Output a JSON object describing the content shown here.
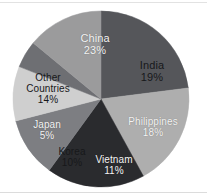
{
  "chart_data": {
    "type": "pie",
    "title": "",
    "subtitle": "",
    "xlabel": "",
    "ylabel": "",
    "legend_position": "none",
    "labels_inside_slices": true,
    "grid": false,
    "units": "percent",
    "total": 100,
    "categories": [
      "China",
      "India",
      "Philippines",
      "Vietnam",
      "Korea",
      "Japan",
      "Other Countries"
    ],
    "values": [
      23,
      19,
      18,
      11,
      10,
      5,
      14
    ],
    "slices": [
      {
        "name": "China",
        "value": 23,
        "value_label": "23%",
        "color": "#55565a",
        "text_color": "#f4f4f4",
        "start_angle": 0,
        "end_angle": 82.8,
        "label_x": 95,
        "label_y": 45,
        "font_size": "fs-11",
        "text_class": "lab-light"
      },
      {
        "name": "India",
        "value": 19,
        "value_label": "19%",
        "color": "#aeaeae",
        "text_color": "#17181a",
        "start_angle": 82.8,
        "end_angle": 151.2,
        "label_x": 152,
        "label_y": 72,
        "font_size": "fs-11",
        "text_class": "lab-dark"
      },
      {
        "name": "Philippines",
        "value": 18,
        "value_label": "18%",
        "color": "#2a2b2e",
        "text_color": "#f4f4f4",
        "start_angle": 151.2,
        "end_angle": 216.0,
        "label_x": 153,
        "label_y": 128,
        "font_size": "fs-10",
        "text_class": "lab-light"
      },
      {
        "name": "Vietnam",
        "value": 11,
        "value_label": "11%",
        "color": "#7d7e82",
        "text_color": "#f4f4f4",
        "start_angle": 216.0,
        "end_angle": 255.6,
        "label_x": 114,
        "label_y": 166,
        "font_size": "fs-10",
        "text_class": "lab-light"
      },
      {
        "name": "Korea",
        "value": 10,
        "value_label": "10%",
        "color": "#cfcfcf",
        "text_color": "#17181a",
        "start_angle": 255.6,
        "end_angle": 291.6,
        "label_x": 72,
        "label_y": 158,
        "font_size": "fs-10",
        "text_class": "lab-dark"
      },
      {
        "name": "Japan",
        "value": 5,
        "value_label": "5%",
        "color": "#6e6f73",
        "text_color": "#f4f4f4",
        "start_angle": 291.6,
        "end_angle": 309.6,
        "label_x": 47,
        "label_y": 131,
        "font_size": "fs-10",
        "text_class": "lab-light"
      },
      {
        "name": "Other Countries",
        "value": 14,
        "value_label": "14%",
        "color": "#9b9b9c",
        "text_color": "#17181a",
        "start_angle": 309.6,
        "end_angle": 360.0,
        "label_x": 48,
        "label_y": 89,
        "font_size": "fs-10",
        "text_class": "lab-dark",
        "name_line_1": "Other",
        "name_line_2": "Countries"
      }
    ],
    "geometry": {
      "center_x": 101,
      "center_y": 99,
      "radius": 88
    },
    "background_color": "#ffffff"
  }
}
